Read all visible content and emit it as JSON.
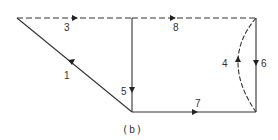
{
  "caption": "(b)",
  "edges": [
    {
      "id": "1",
      "label": "1",
      "style": "solid",
      "direction": "toward top-left node"
    },
    {
      "id": "3",
      "label": "3",
      "style": "dashed",
      "direction": "toward right"
    },
    {
      "id": "5",
      "label": "5",
      "style": "solid",
      "direction": "down"
    },
    {
      "id": "8",
      "label": "8",
      "style": "dashed",
      "direction": "toward right"
    },
    {
      "id": "4",
      "label": "4",
      "style": "dashed-arc",
      "direction": "up"
    },
    {
      "id": "6",
      "label": "6",
      "style": "solid",
      "direction": "down"
    },
    {
      "id": "7",
      "label": "7",
      "style": "solid",
      "direction": "toward right"
    }
  ],
  "labels": {
    "e1": "1",
    "e3": "3",
    "e4": "4",
    "e5": "5",
    "e6": "6",
    "e7": "7",
    "e8": "8"
  }
}
